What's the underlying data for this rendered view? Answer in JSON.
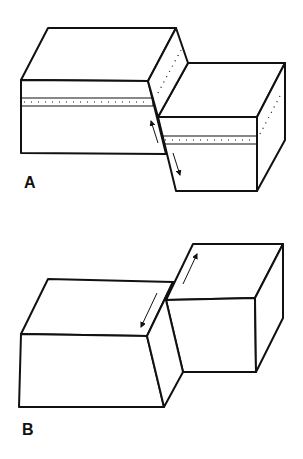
{
  "figure": {
    "panels": [
      {
        "label": "A",
        "description": "Block diagram of dip-slip fault with displaced dotted stratum; arrows show vertical relative motion along fault plane"
      },
      {
        "label": "B",
        "description": "Block diagram of strike-slip fault; arrows show horizontal relative motion along fault plane"
      }
    ],
    "colors": {
      "line": "#111111",
      "background": "#ffffff"
    }
  }
}
